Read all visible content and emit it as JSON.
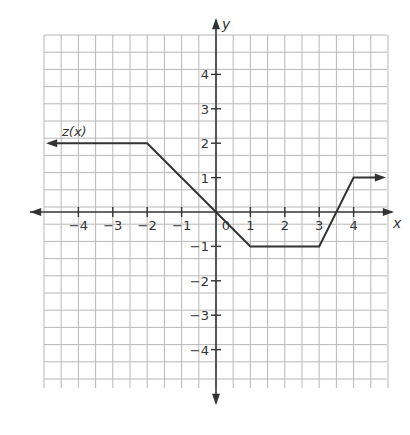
{
  "chart_data": {
    "type": "line",
    "title": "",
    "function_label": "z(x)",
    "xlabel": "x",
    "ylabel": "y",
    "xlim": [
      -5,
      5
    ],
    "ylim": [
      -5,
      5
    ],
    "grid": true,
    "grid_step": 0.5,
    "x_ticks": [
      -4,
      -3,
      -2,
      -1,
      0,
      1,
      2,
      3,
      4
    ],
    "y_ticks": [
      -4,
      -3,
      -2,
      -1,
      1,
      2,
      3,
      4
    ],
    "x_tick_labels": [
      "−4",
      "−3",
      "−2",
      "−1",
      "0",
      "1",
      "2",
      "3",
      "4"
    ],
    "y_tick_labels": [
      "−4",
      "−3",
      "−2",
      "−1",
      "1",
      "2",
      "3",
      "4"
    ],
    "series": [
      {
        "name": "z(x)",
        "x": [
          -5,
          -2,
          1,
          3,
          4,
          5
        ],
        "y": [
          2,
          2,
          -1,
          -1,
          1,
          1
        ],
        "left_arrow": true,
        "right_arrow": true
      }
    ]
  },
  "colors": {
    "grid": "#b8b8b8",
    "axis": "#333333",
    "curve": "#333333"
  }
}
